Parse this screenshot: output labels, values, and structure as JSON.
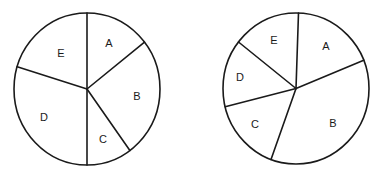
{
  "chart_data": [
    {
      "type": "pie",
      "title": "",
      "categories": [
        "A",
        "B",
        "C",
        "D",
        "E"
      ],
      "values": [
        14.5,
        25.5,
        10,
        30,
        20
      ],
      "units": "percent (estimated from slice angles)",
      "start_angle_deg_clockwise_from_top": 0,
      "boundaries_deg": [
        0,
        52,
        144,
        180,
        287
      ],
      "legend": null,
      "labels_inside_slices": true
    },
    {
      "type": "pie",
      "title": "",
      "categories": [
        "A",
        "B",
        "C",
        "D",
        "E"
      ],
      "values": [
        18,
        37,
        15.5,
        14.5,
        15
      ],
      "units": "percent (estimated from slice angles)",
      "start_angle_deg_clockwise_from_top": 2,
      "boundaries_deg": [
        2,
        68,
        200,
        256,
        308
      ],
      "legend": null,
      "labels_inside_slices": true
    }
  ],
  "pies": [
    {
      "cx": 87,
      "cy": 89,
      "rx": 73,
      "ry": 76,
      "boundaries_deg": [
        0,
        52,
        144,
        180,
        287
      ],
      "labels": [
        {
          "text": "A",
          "x": 109,
          "y": 43
        },
        {
          "text": "B",
          "x": 137,
          "y": 96
        },
        {
          "text": "C",
          "x": 103,
          "y": 139
        },
        {
          "text": "D",
          "x": 44,
          "y": 117
        },
        {
          "text": "E",
          "x": 61,
          "y": 53
        }
      ]
    },
    {
      "cx": 296,
      "cy": 88.5,
      "rx": 73,
      "ry": 75.5,
      "boundaries_deg": [
        2,
        68,
        200,
        256,
        308
      ],
      "labels": [
        {
          "text": "A",
          "x": 326,
          "y": 46
        },
        {
          "text": "B",
          "x": 333,
          "y": 123
        },
        {
          "text": "C",
          "x": 255,
          "y": 124
        },
        {
          "text": "D",
          "x": 240,
          "y": 77
        },
        {
          "text": "E",
          "x": 274,
          "y": 40
        }
      ]
    }
  ],
  "colors": {
    "stroke": "#1a1a1a",
    "fill": "#ffffff",
    "background": "#ffffff"
  }
}
